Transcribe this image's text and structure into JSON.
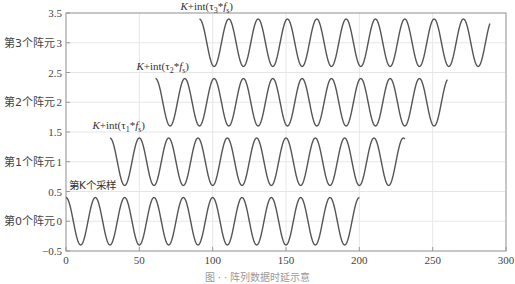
{
  "chart_data": {
    "type": "line",
    "title": "",
    "xlabel": "",
    "ylabel": "",
    "xlim": [
      0,
      300
    ],
    "ylim": [
      -0.5,
      3.5
    ],
    "grid": true,
    "xticks": [
      0,
      50,
      100,
      150,
      200,
      250,
      300
    ],
    "yticks": [
      -0.5,
      0,
      0.5,
      1,
      1.5,
      2,
      2.5,
      3,
      3.5
    ],
    "ytick_labels": [
      "-0.5",
      "0",
      "0.5",
      "1",
      "1.5",
      "2",
      "2.5",
      "3",
      "3.5"
    ],
    "row_labels": [
      {
        "text": "第0个阵元",
        "y": 0
      },
      {
        "text": "第1个阵元",
        "y": 1
      },
      {
        "text": "第2个阵元",
        "y": 2
      },
      {
        "text": "第3个阵元",
        "y": 3
      }
    ],
    "series": [
      {
        "name": "第0个阵元",
        "offset": 0,
        "amplitude": 0.4,
        "period": 20,
        "x_start": 0,
        "x_end": 200
      },
      {
        "name": "第1个阵元",
        "offset": 1,
        "amplitude": 0.4,
        "period": 20,
        "x_start": 30,
        "x_end": 231
      },
      {
        "name": "第2个阵元",
        "offset": 2,
        "amplitude": 0.4,
        "period": 20,
        "x_start": 61,
        "x_end": 260
      },
      {
        "name": "第3个阵元",
        "offset": 3,
        "amplitude": 0.4,
        "period": 20,
        "x_start": 91,
        "x_end": 289
      }
    ],
    "annotations": [
      {
        "text": "第K个采样",
        "x": 2,
        "y": 0.55
      },
      {
        "text_parts": [
          "K",
          "+int(τ",
          "1",
          "*",
          "f",
          "s",
          ")"
        ],
        "x": 18,
        "y": 1.55
      },
      {
        "text_parts": [
          "K",
          "+int(τ",
          "2",
          "*",
          "f",
          "s",
          ")"
        ],
        "x": 48,
        "y": 2.55
      },
      {
        "text_parts": [
          "K",
          "+int(τ",
          "3",
          "*",
          "f",
          "s",
          ")"
        ],
        "x": 78,
        "y": 3.55
      }
    ],
    "line_color": "#555555",
    "grid_color": "#e6e6e6",
    "axis_color": "#999999"
  },
  "caption": "图 · · 阵列数据时延示意"
}
